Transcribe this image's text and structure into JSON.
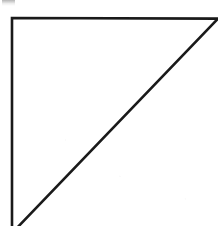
{
  "figure": {
    "name": "right-triangle",
    "background_color": "#ffffff",
    "stroke_color": "#1a1a1a",
    "stroke_width": 2.6,
    "canvas": {
      "width": 218,
      "height": 226
    },
    "vertices": {
      "top_left": {
        "x": 12,
        "y": 18
      },
      "top_right": {
        "x": 217,
        "y": 19
      },
      "bottom_left": {
        "x": 14,
        "y": 230
      }
    },
    "edges": [
      {
        "label": "top-edge",
        "from": "top_left",
        "to": "top_right",
        "orientation": "horizontal"
      },
      {
        "label": "left-edge",
        "from": "top_left",
        "to": "bottom_left",
        "orientation": "vertical"
      },
      {
        "label": "hypotenuse",
        "from": "top_right",
        "to": "bottom_left",
        "orientation": "diagonal"
      }
    ],
    "right_angle_at": "top_left"
  },
  "artifacts": {
    "top_left_smudge": {
      "label": "scan-smudge",
      "color": "#787878",
      "x": 2,
      "y": 0,
      "width": 13,
      "height": 6
    }
  }
}
